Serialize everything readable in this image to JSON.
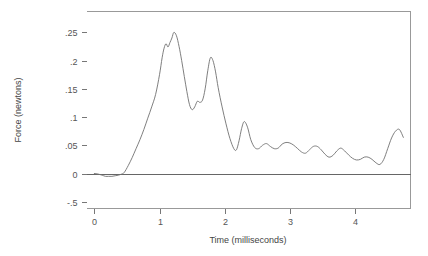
{
  "chart_data": {
    "type": "line",
    "title": "",
    "xlabel": "Time (milliseconds)",
    "ylabel": "Force (newtons)",
    "xlim": [
      -0.12,
      4.85
    ],
    "ylim": [
      -0.062,
      0.287
    ],
    "grid": false,
    "legend": false,
    "xticks": [
      0,
      1,
      2,
      3,
      4
    ],
    "xtick_labels": [
      "0",
      "1",
      "2",
      "3",
      "4"
    ],
    "yticks": [
      -0.05,
      0,
      0.05,
      0.1,
      0.15,
      0.2,
      0.25
    ],
    "ytick_labels": [
      "-.5",
      "0",
      ".05",
      ".1",
      ".15",
      ".2",
      ".25"
    ],
    "series": [
      {
        "name": "force",
        "color": "#707070",
        "x": [
          0.0,
          0.06,
          0.12,
          0.17,
          0.22,
          0.27,
          0.32,
          0.37,
          0.42,
          0.46,
          0.52,
          0.58,
          0.64,
          0.7,
          0.76,
          0.82,
          0.88,
          0.94,
          1.0,
          1.04,
          1.07,
          1.1,
          1.13,
          1.16,
          1.19,
          1.22,
          1.26,
          1.3,
          1.34,
          1.38,
          1.42,
          1.46,
          1.5,
          1.54,
          1.58,
          1.62,
          1.66,
          1.7,
          1.74,
          1.78,
          1.82,
          1.86,
          1.9,
          1.96,
          2.02,
          2.08,
          2.14,
          2.18,
          2.22,
          2.26,
          2.3,
          2.35,
          2.4,
          2.46,
          2.52,
          2.58,
          2.64,
          2.7,
          2.76,
          2.82,
          2.88,
          2.94,
          3.0,
          3.06,
          3.12,
          3.18,
          3.24,
          3.3,
          3.36,
          3.42,
          3.48,
          3.54,
          3.6,
          3.66,
          3.72,
          3.78,
          3.84,
          3.9,
          3.96,
          4.02,
          4.08,
          4.14,
          4.2,
          4.26,
          4.32,
          4.38,
          4.44,
          4.5,
          4.56,
          4.62,
          4.68,
          4.74
        ],
        "y": [
          0.0,
          -0.001,
          -0.003,
          -0.005,
          -0.005,
          -0.005,
          -0.004,
          -0.003,
          -0.001,
          0.002,
          0.014,
          0.028,
          0.044,
          0.06,
          0.078,
          0.098,
          0.118,
          0.14,
          0.175,
          0.205,
          0.222,
          0.23,
          0.224,
          0.232,
          0.24,
          0.25,
          0.244,
          0.225,
          0.2,
          0.172,
          0.145,
          0.122,
          0.113,
          0.118,
          0.128,
          0.126,
          0.13,
          0.15,
          0.182,
          0.205,
          0.2,
          0.18,
          0.152,
          0.118,
          0.088,
          0.062,
          0.044,
          0.042,
          0.058,
          0.08,
          0.092,
          0.082,
          0.06,
          0.046,
          0.044,
          0.05,
          0.053,
          0.048,
          0.044,
          0.045,
          0.052,
          0.055,
          0.054,
          0.05,
          0.044,
          0.038,
          0.036,
          0.042,
          0.048,
          0.048,
          0.042,
          0.034,
          0.029,
          0.032,
          0.04,
          0.045,
          0.04,
          0.033,
          0.027,
          0.024,
          0.025,
          0.029,
          0.029,
          0.025,
          0.019,
          0.016,
          0.025,
          0.044,
          0.063,
          0.075,
          0.078,
          0.064
        ]
      }
    ],
    "annotations": {
      "zero_reference_line": 0
    }
  },
  "axis_titles": {
    "x": "Time (milliseconds)",
    "y": "Force (newtons)"
  }
}
